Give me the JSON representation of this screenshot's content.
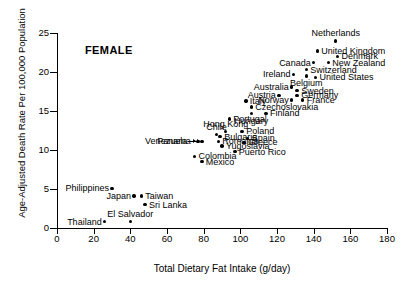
{
  "chart_data": {
    "type": "scatter",
    "title": "",
    "annotation": "FEMALE",
    "xlabel": "Total Dietary Fat Intake (g/day)",
    "ylabel": "Age-Adjusted Death Rate Per 100,000 Population",
    "xlim": [
      0,
      180
    ],
    "ylim": [
      0,
      25
    ],
    "xticks": [
      0,
      20,
      40,
      60,
      80,
      100,
      120,
      140,
      160,
      180
    ],
    "yticks": [
      0,
      5,
      10,
      15,
      20,
      25
    ],
    "grid": false,
    "legend": null,
    "points": [
      {
        "label": "Netherlands",
        "x": 152,
        "y": 24.0,
        "lpos": "above"
      },
      {
        "label": "United Kingdom",
        "x": 142,
        "y": 22.7,
        "lpos": "right"
      },
      {
        "label": "Denmark",
        "x": 153,
        "y": 22.0,
        "lpos": "right"
      },
      {
        "label": "New Zealand",
        "x": 148,
        "y": 21.2,
        "lpos": "right"
      },
      {
        "label": "Canada",
        "x": 140,
        "y": 21.2,
        "lpos": "left"
      },
      {
        "label": "Switzerland",
        "x": 136,
        "y": 20.3,
        "lpos": "right"
      },
      {
        "label": "Ireland",
        "x": 129,
        "y": 19.7,
        "lpos": "left"
      },
      {
        "label": "United States",
        "x": 141,
        "y": 19.3,
        "lpos": "right"
      },
      {
        "label": "Belgium",
        "x": 136,
        "y": 19.5,
        "lpos": "below"
      },
      {
        "label": "Australia",
        "x": 128,
        "y": 18.1,
        "lpos": "left"
      },
      {
        "label": "Sweden",
        "x": 131,
        "y": 17.6,
        "lpos": "right"
      },
      {
        "label": "Austria",
        "x": 121,
        "y": 17.0,
        "lpos": "left"
      },
      {
        "label": "Germany",
        "x": 131,
        "y": 17.0,
        "lpos": "right"
      },
      {
        "label": "Norway",
        "x": 128,
        "y": 16.4,
        "lpos": "left"
      },
      {
        "label": "France",
        "x": 134,
        "y": 16.4,
        "lpos": "right"
      },
      {
        "label": "Italy",
        "x": 103,
        "y": 16.3,
        "lpos": "right"
      },
      {
        "label": "Czechoslovakia",
        "x": 106,
        "y": 15.5,
        "lpos": "right"
      },
      {
        "label": "Finland",
        "x": 114,
        "y": 14.7,
        "lpos": "right"
      },
      {
        "label": "Hungary",
        "x": 106,
        "y": 14.7,
        "lpos": "below"
      },
      {
        "label": "Portugal",
        "x": 94,
        "y": 14.0,
        "lpos": "right"
      },
      {
        "label": "Hong Kong",
        "x": 92,
        "y": 12.4,
        "lpos": "above"
      },
      {
        "label": "Poland",
        "x": 101,
        "y": 12.4,
        "lpos": "right"
      },
      {
        "label": "Bulgaria",
        "x": 89,
        "y": 11.7,
        "lpos": "right"
      },
      {
        "label": "Chile",
        "x": 87,
        "y": 12.0,
        "lpos": "above"
      },
      {
        "label": "Spain",
        "x": 104,
        "y": 11.5,
        "lpos": "right"
      },
      {
        "label": "Venezuela",
        "x": 77,
        "y": 11.1,
        "lpos": "leader"
      },
      {
        "label": "Romania",
        "x": 88,
        "y": 11.1,
        "lpos": "right"
      },
      {
        "label": "Greece",
        "x": 102,
        "y": 11.0,
        "lpos": "right"
      },
      {
        "label": "Panama",
        "x": 79,
        "y": 11.1,
        "lpos": "leader"
      },
      {
        "label": "Yugoslavia",
        "x": 90,
        "y": 10.5,
        "lpos": "right"
      },
      {
        "label": "Colombia",
        "x": 75,
        "y": 9.2,
        "lpos": "right"
      },
      {
        "label": "Puerto Rico",
        "x": 97,
        "y": 9.8,
        "lpos": "right"
      },
      {
        "label": "Philippines",
        "x": 30,
        "y": 5.1,
        "lpos": "left"
      },
      {
        "label": "Mexico",
        "x": 79,
        "y": 8.5,
        "lpos": "right"
      },
      {
        "label": "Japan",
        "x": 42,
        "y": 4.1,
        "lpos": "left"
      },
      {
        "label": "Taiwan",
        "x": 46,
        "y": 4.1,
        "lpos": "right"
      },
      {
        "label": "Sri Lanka",
        "x": 48,
        "y": 3.0,
        "lpos": "right"
      },
      {
        "label": "Thailand",
        "x": 26,
        "y": 0.8,
        "lpos": "left"
      },
      {
        "label": "El Salvador",
        "x": 40,
        "y": 0.8,
        "lpos": "above"
      }
    ]
  }
}
